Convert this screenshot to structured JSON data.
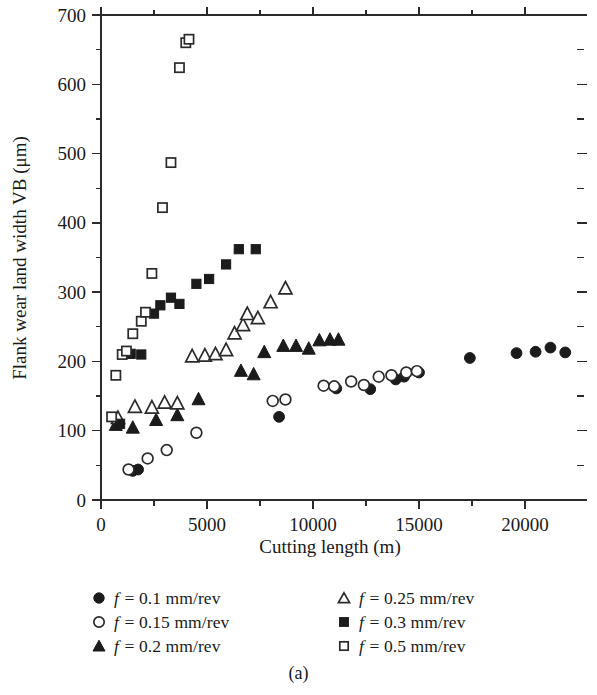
{
  "caption": "(a)",
  "axes": {
    "xlabel": "Cutting length (m)",
    "ylabel": "Flank wear land width VB (μm)",
    "x_ticks": [
      "0",
      "5000",
      "10000",
      "15000",
      "20000"
    ],
    "y_ticks": [
      "0",
      "100",
      "200",
      "300",
      "400",
      "500",
      "600",
      "700"
    ]
  },
  "legend": {
    "left": [
      {
        "marker": "filled-circle",
        "label": "f = 0.1 mm/rev",
        "symbol_name": "legend-marker-filled-circle"
      },
      {
        "marker": "open-circle",
        "label": "f = 0.15 mm/rev",
        "symbol_name": "legend-marker-open-circle"
      },
      {
        "marker": "filled-triangle",
        "label": "f = 0.2 mm/rev",
        "symbol_name": "legend-marker-filled-triangle"
      }
    ],
    "right": [
      {
        "marker": "open-triangle",
        "label": "f = 0.25 mm/rev",
        "symbol_name": "legend-marker-open-triangle"
      },
      {
        "marker": "filled-square",
        "label": "f = 0.3 mm/rev",
        "symbol_name": "legend-marker-filled-square"
      },
      {
        "marker": "open-square",
        "label": "f = 0.5 mm/rev",
        "symbol_name": "legend-marker-open-square"
      }
    ]
  },
  "chart_data": {
    "type": "scatter",
    "title": "",
    "xlabel": "Cutting length (m)",
    "ylabel": "Flank wear land width VB (μm)",
    "xlim": [
      0,
      22500
    ],
    "ylim": [
      0,
      700
    ],
    "xticks": [
      0,
      5000,
      10000,
      15000,
      20000
    ],
    "yticks": [
      0,
      100,
      200,
      300,
      400,
      500,
      600,
      700
    ],
    "x_minor_step": 2500,
    "y_minor_step": 50,
    "grid": false,
    "legend_position": "below-axes",
    "series": [
      {
        "name": "f = 0.1 mm/rev",
        "marker": "filled-circle",
        "points": [
          [
            1500,
            42
          ],
          [
            1750,
            44
          ],
          [
            8400,
            120
          ],
          [
            11100,
            161
          ],
          [
            12700,
            160
          ],
          [
            13900,
            174
          ],
          [
            14300,
            178
          ],
          [
            15000,
            184
          ],
          [
            17400,
            205
          ],
          [
            19600,
            212
          ],
          [
            20500,
            214
          ],
          [
            21200,
            220
          ],
          [
            21900,
            213
          ]
        ]
      },
      {
        "name": "f = 0.15 mm/rev",
        "marker": "open-circle",
        "points": [
          [
            1300,
            44
          ],
          [
            2200,
            60
          ],
          [
            3100,
            72
          ],
          [
            4500,
            97
          ],
          [
            8100,
            143
          ],
          [
            8700,
            145
          ],
          [
            10500,
            165
          ],
          [
            11000,
            164
          ],
          [
            11800,
            171
          ],
          [
            12400,
            166
          ],
          [
            13100,
            178
          ],
          [
            13700,
            180
          ],
          [
            14400,
            184
          ],
          [
            14900,
            186
          ]
        ]
      },
      {
        "name": "f = 0.2 mm/rev",
        "marker": "filled-triangle",
        "points": [
          [
            700,
            108
          ],
          [
            1500,
            104
          ],
          [
            2600,
            115
          ],
          [
            3600,
            122
          ],
          [
            4600,
            145
          ],
          [
            6600,
            186
          ],
          [
            7200,
            181
          ],
          [
            7700,
            213
          ],
          [
            8600,
            222
          ],
          [
            9200,
            222
          ],
          [
            9800,
            218
          ],
          [
            10300,
            230
          ],
          [
            10800,
            231
          ],
          [
            11200,
            231
          ]
        ]
      },
      {
        "name": "f = 0.25 mm/rev",
        "marker": "open-triangle",
        "points": [
          [
            800,
            118
          ],
          [
            1600,
            134
          ],
          [
            2400,
            133
          ],
          [
            3000,
            140
          ],
          [
            3600,
            139
          ],
          [
            4300,
            207
          ],
          [
            4900,
            208
          ],
          [
            5400,
            210
          ],
          [
            5900,
            216
          ],
          [
            6300,
            240
          ],
          [
            6700,
            252
          ],
          [
            6900,
            268
          ],
          [
            7400,
            262
          ],
          [
            8000,
            285
          ],
          [
            8700,
            305
          ]
        ]
      },
      {
        "name": "f = 0.3 mm/rev",
        "marker": "filled-square",
        "points": [
          [
            900,
            110
          ],
          [
            1400,
            211
          ],
          [
            1900,
            210
          ],
          [
            2500,
            269
          ],
          [
            2800,
            281
          ],
          [
            3300,
            292
          ],
          [
            3700,
            283
          ],
          [
            4500,
            312
          ],
          [
            5100,
            319
          ],
          [
            5900,
            340
          ],
          [
            6500,
            362
          ],
          [
            7300,
            362
          ]
        ]
      },
      {
        "name": "f = 0.5 mm/rev",
        "marker": "open-square",
        "points": [
          [
            500,
            120
          ],
          [
            700,
            180
          ],
          [
            1000,
            210
          ],
          [
            1200,
            215
          ],
          [
            1500,
            240
          ],
          [
            1900,
            258
          ],
          [
            2100,
            271
          ],
          [
            2400,
            327
          ],
          [
            2900,
            422
          ],
          [
            3300,
            487
          ],
          [
            3700,
            624
          ],
          [
            4000,
            660
          ],
          [
            4150,
            665
          ]
        ]
      }
    ]
  }
}
